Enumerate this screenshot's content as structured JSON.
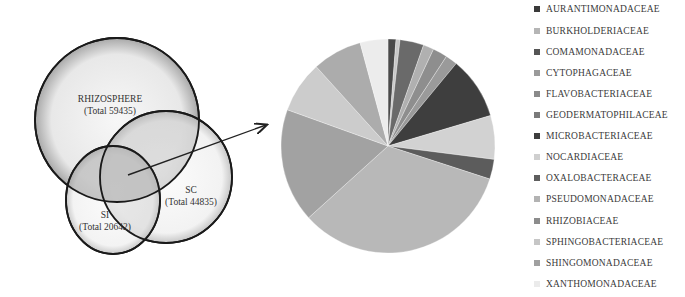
{
  "venn": {
    "sets": [
      {
        "name": "RHIZOSPHERE",
        "total_label": "(Total 59435)",
        "total": 59435
      },
      {
        "name": "SC",
        "total_label": "(Total 44835)",
        "total": 44835
      },
      {
        "name": "SI",
        "total_label": "(Total 20642)",
        "total": 20642
      }
    ]
  },
  "chart_data": {
    "type": "pie",
    "title": "",
    "legend_position": "right",
    "categories": [
      "AURANTIMONADACEAE",
      "BURKHOLDERIACEAE",
      "COMAMONADACEAE",
      "CYTOPHAGACEAE",
      "FLAVOBACTERIACEAE",
      "GEODERMATOPHILACEAE",
      "MICROBACTERIACEAE",
      "NOCARDIACEAE",
      "OXALOBACTERACEAE",
      "PSEUDOMONADACEAE",
      "RHIZOBIACEAE",
      "SPHINGOBACTERIACEAE",
      "SHINGOMONADACEAE",
      "XANTHOMONADACEAE"
    ],
    "values": [
      1.2,
      0.6,
      3.6,
      1.6,
      2.2,
      1.8,
      9.4,
      6.6,
      3.0,
      33.3,
      17.2,
      7.8,
      7.5,
      4.2
    ],
    "colors": [
      "#4a4a4a",
      "#c8c8c8",
      "#6a6a6a",
      "#b0b0b0",
      "#8e8e8e",
      "#9a9a9a",
      "#3e3e3e",
      "#d2d2d2",
      "#5c5c5c",
      "#b8b8b8",
      "#a2a2a2",
      "#cccccc",
      "#acacac",
      "#ececec"
    ]
  },
  "legend": {
    "items": [
      {
        "label": "AURANTIMONADACEAE",
        "color": "#3a3a3a"
      },
      {
        "label": "BURKHOLDERIACEAE",
        "color": "#b5b5b5"
      },
      {
        "label": "COMAMONADACEAE",
        "color": "#555555"
      },
      {
        "label": "CYTOPHAGACEAE",
        "color": "#9a9a9a"
      },
      {
        "label": "FLAVOBACTERIACEAE",
        "color": "#8a8a8a"
      },
      {
        "label": "GEODERMATOPHILACEAE",
        "color": "#7a7a7a"
      },
      {
        "label": "MICROBACTERIACEAE",
        "color": "#3e3e3e"
      },
      {
        "label": "NOCARDIACEAE",
        "color": "#cfcfcf"
      },
      {
        "label": "OXALOBACTERACEAE",
        "color": "#5e5e5e"
      },
      {
        "label": "PSEUDOMONADACEAE",
        "color": "#b3b3b3"
      },
      {
        "label": "RHIZOBIACEAE",
        "color": "#8c8c8c"
      },
      {
        "label": "SPHINGOBACTERIACEAE",
        "color": "#c6c6c6"
      },
      {
        "label": "SHINGOMONADACEAE",
        "color": "#a0a0a0"
      },
      {
        "label": "XANTHOMONADACEAE",
        "color": "#ebebeb"
      }
    ]
  }
}
